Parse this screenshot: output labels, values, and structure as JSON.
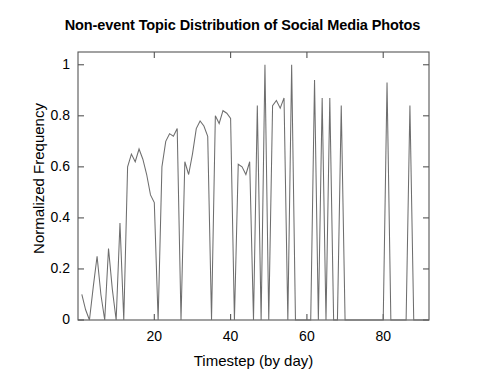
{
  "chart_data": {
    "type": "line",
    "title": "Non-event Topic Distribution of Social Media Photos",
    "xlabel": "Timestep (by day)",
    "ylabel": "Normalized Frequency",
    "xlim": [
      0,
      92
    ],
    "ylim": [
      0,
      1.05
    ],
    "grid": false,
    "legend": null,
    "line_color": "#6e6e6e",
    "axis_color": "#555555",
    "background": "#ffffff",
    "xticks": [
      20,
      40,
      60,
      80
    ],
    "xtick_labels": [
      "20",
      "40",
      "60",
      "80"
    ],
    "yticks": [
      0,
      0.2,
      0.4,
      0.6,
      0.8,
      1
    ],
    "ytick_labels": [
      "0",
      "0.2",
      "0.4",
      "0.6",
      "0.8",
      "1"
    ],
    "x": [
      1,
      2,
      3,
      4,
      5,
      6,
      7,
      8,
      9,
      10,
      11,
      12,
      13,
      14,
      15,
      16,
      17,
      18,
      19,
      20,
      21,
      22,
      23,
      24,
      25,
      26,
      27,
      28,
      29,
      30,
      31,
      32,
      33,
      34,
      35,
      36,
      37,
      38,
      39,
      40,
      41,
      42,
      43,
      44,
      45,
      46,
      47,
      48,
      49,
      50,
      51,
      52,
      53,
      54,
      55,
      56,
      57,
      58,
      59,
      60,
      61,
      62,
      63,
      64,
      65,
      66,
      67,
      68,
      69,
      70,
      71,
      72,
      73,
      74,
      75,
      76,
      77,
      78,
      79,
      80,
      81,
      82,
      83,
      84,
      85,
      86,
      87,
      88,
      89,
      90,
      91,
      92
    ],
    "values": [
      0.1,
      0.04,
      0.0,
      0.13,
      0.25,
      0.1,
      0.0,
      0.28,
      0.12,
      0.0,
      0.38,
      0.0,
      0.6,
      0.65,
      0.62,
      0.67,
      0.63,
      0.57,
      0.49,
      0.46,
      0.0,
      0.6,
      0.7,
      0.73,
      0.72,
      0.75,
      0.0,
      0.62,
      0.57,
      0.65,
      0.75,
      0.78,
      0.76,
      0.72,
      0.0,
      0.8,
      0.77,
      0.82,
      0.81,
      0.79,
      0.0,
      0.61,
      0.6,
      0.57,
      0.62,
      0.0,
      0.84,
      0.0,
      1.0,
      0.0,
      0.84,
      0.86,
      0.83,
      0.87,
      0.0,
      1.0,
      0.0,
      0.0,
      0.0,
      0.0,
      0.0,
      0.94,
      0.0,
      0.87,
      0.0,
      0.87,
      0.0,
      0.0,
      0.84,
      0.0,
      0.0,
      0.0,
      0.0,
      0.0,
      0.0,
      0.0,
      0.0,
      0.0,
      0.0,
      0.0,
      0.93,
      0.0,
      0.0,
      0.0,
      0.0,
      0.0,
      0.84,
      0.0,
      0.0,
      0.0,
      0.0,
      0.0
    ]
  }
}
